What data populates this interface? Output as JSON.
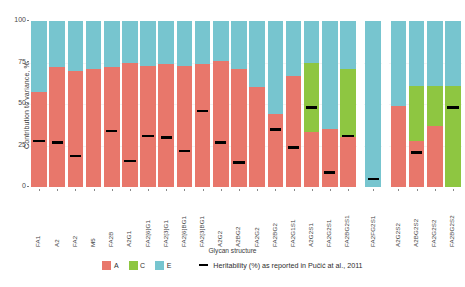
{
  "chart_data": {
    "type": "bar",
    "title": "",
    "xlabel": "Glycan structure",
    "ylabel": "Contribution to variance, %",
    "ylim": [
      0,
      100
    ],
    "yticks": [
      "0",
      "25",
      "50",
      "75",
      "100"
    ],
    "grid": true,
    "stacked": true,
    "legend_position": "bottom",
    "series": [
      {
        "name": "A",
        "color": "#e8776b"
      },
      {
        "name": "C",
        "color": "#8ec641"
      },
      {
        "name": "E",
        "color": "#77c5cf"
      }
    ],
    "annotation_series": {
      "name": "Heritability (%) as reported in Pučić at al., 2011",
      "color": "#000000",
      "marker": "dash"
    },
    "categories": [
      "FA1",
      "A2",
      "FA2",
      "M5",
      "FA2B",
      "A2G1",
      "FA2[6]G1",
      "FA2[3]G1",
      "FA2[6]BG1",
      "FA2[3]BG1",
      "A2G2",
      "A2BG2",
      "FA2G2",
      "FA2BG2",
      "FA2G1S1",
      "A2G2S1",
      "FA2G2S1",
      "FA2BG2S1",
      "FA2FG2S1",
      "A2G2S2",
      "A2BG2S2",
      "FA2G2S2",
      "FA2BG2S2"
    ],
    "panels": [
      {
        "start": 0,
        "end": 18
      },
      {
        "start": 18,
        "end": 19
      },
      {
        "start": 19,
        "end": 23
      }
    ],
    "values": {
      "A": [
        57,
        72,
        70,
        71,
        72,
        75,
        73,
        74,
        73,
        74,
        76,
        71,
        60,
        44,
        67,
        33,
        35,
        30,
        0,
        49,
        28,
        37,
        0
      ],
      "C": [
        0,
        0,
        0,
        0,
        0,
        0,
        0,
        0,
        0,
        0,
        0,
        0,
        0,
        0,
        0,
        42,
        0,
        41,
        0,
        0,
        33,
        24,
        61
      ],
      "E": [
        43,
        28,
        30,
        29,
        28,
        25,
        27,
        26,
        27,
        26,
        24,
        29,
        40,
        56,
        33,
        25,
        65,
        29,
        100,
        51,
        39,
        39,
        39
      ]
    },
    "heritability": [
      27,
      26,
      18,
      null,
      33,
      15,
      30,
      29,
      21,
      45,
      26,
      14,
      null,
      34,
      23,
      47,
      8,
      30,
      4,
      null,
      20,
      null,
      47
    ]
  }
}
